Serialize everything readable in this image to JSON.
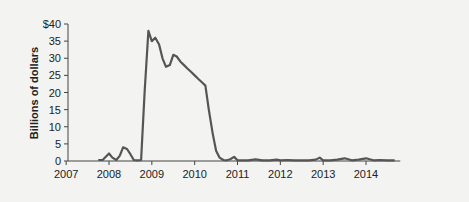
{
  "chart_data": {
    "type": "line",
    "title": "",
    "xlabel": "",
    "ylabel": "Billions of dollars",
    "ylim": [
      0,
      40
    ],
    "xlim": [
      2007,
      2014.8
    ],
    "yticks": [
      "0",
      "5",
      "10",
      "15",
      "20",
      "25",
      "30",
      "35",
      "$40"
    ],
    "ytick_values": [
      0,
      5,
      10,
      15,
      20,
      25,
      30,
      35,
      40
    ],
    "xticks": [
      "2007",
      "2008",
      "2009",
      "2010",
      "2011",
      "2012",
      "2013",
      "2014"
    ],
    "xtick_values": [
      2007,
      2008,
      2009,
      2010,
      2011,
      2012,
      2013,
      2014
    ],
    "grid": false,
    "legend": null,
    "series": [
      {
        "name": "Billions of dollars",
        "color": "#555555",
        "x": [
          2007.75,
          2007.85,
          2007.92,
          2008.0,
          2008.08,
          2008.17,
          2008.25,
          2008.33,
          2008.42,
          2008.5,
          2008.58,
          2008.67,
          2008.75,
          2008.83,
          2008.92,
          2009.0,
          2009.08,
          2009.17,
          2009.25,
          2009.33,
          2009.42,
          2009.5,
          2009.58,
          2009.67,
          2009.75,
          2009.83,
          2009.92,
          2010.0,
          2010.08,
          2010.17,
          2010.25,
          2010.33,
          2010.42,
          2010.5,
          2010.58,
          2010.67,
          2010.75,
          2010.83,
          2010.92,
          2011.0,
          2011.08,
          2011.25,
          2011.42,
          2011.58,
          2011.75,
          2011.92,
          2012.0,
          2012.17,
          2012.33,
          2012.5,
          2012.67,
          2012.83,
          2012.92,
          2013.0,
          2013.17,
          2013.33,
          2013.5,
          2013.67,
          2013.83,
          2014.0,
          2014.17,
          2014.33,
          2014.5,
          2014.67
        ],
        "values": [
          0.3,
          0.3,
          1.2,
          2.2,
          1.0,
          0.3,
          1.5,
          4.0,
          3.5,
          2.0,
          0.3,
          0.2,
          0.3,
          20,
          38,
          35,
          36,
          34,
          30,
          27.5,
          28,
          31,
          30.5,
          29,
          28,
          27,
          26,
          25,
          24,
          23,
          22,
          15,
          8,
          3,
          1.0,
          0.3,
          0.2,
          0.5,
          1.2,
          0.2,
          0.2,
          0.2,
          0.5,
          0.2,
          0.2,
          0.4,
          0.2,
          0.3,
          0.2,
          0.2,
          0.2,
          0.4,
          1.0,
          0.2,
          0.2,
          0.4,
          0.8,
          0.2,
          0.4,
          0.8,
          0.2,
          0.3,
          0.2,
          0.2
        ]
      }
    ]
  }
}
